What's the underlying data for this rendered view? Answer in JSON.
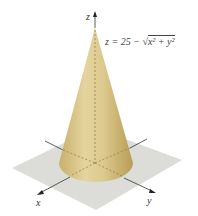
{
  "figure": {
    "type": "3d-surface-plot",
    "surface": "cone",
    "equation": "z = 25 − √x² + y²",
    "equation_parts": {
      "lhs": "z = 25 − ",
      "radical": "√",
      "radicand": "x² + y²"
    },
    "axes": {
      "x_label": "x",
      "y_label": "y",
      "z_label": "z"
    },
    "colors": {
      "cone": "#d8c487",
      "cone_shadow": "#b39a55",
      "plane": "#dcdcd8",
      "axis": "#333333"
    }
  }
}
